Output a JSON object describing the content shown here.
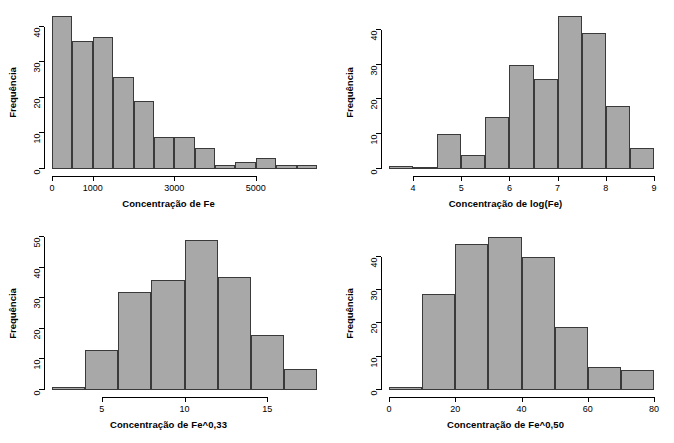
{
  "figure": {
    "panel_count": 4,
    "bar_fill_color": "#a8a8a8",
    "bar_border_color": "#3a3a3a",
    "background_color": "#ffffff"
  },
  "chart_data": [
    {
      "type": "bar",
      "panel": "top-left",
      "title": "",
      "xlabel": "Concentração de Fe",
      "ylabel": "Frequência",
      "xticks": [
        0,
        1000,
        3000,
        5000
      ],
      "xtick_labels": [
        "0",
        "1000",
        "3000",
        "5000"
      ],
      "yticks": [
        0,
        10,
        20,
        30,
        40
      ],
      "ytick_labels": [
        "0",
        "10",
        "20",
        "30",
        "40"
      ],
      "xlim": [
        0,
        6500
      ],
      "ylim": [
        0,
        43
      ],
      "bin_width": 500,
      "bin_edges": [
        0,
        500,
        1000,
        1500,
        2000,
        2500,
        3000,
        3500,
        4000,
        4500,
        5000,
        5500,
        6000,
        6500
      ],
      "values": [
        43,
        36,
        37,
        26,
        19,
        9,
        9,
        6,
        1,
        2,
        3,
        1,
        1
      ],
      "grid": false,
      "legend": "none"
    },
    {
      "type": "bar",
      "panel": "top-right",
      "title": "",
      "xlabel": "Concentração de log(Fe)",
      "ylabel": "Frequência",
      "xticks": [
        4,
        5,
        6,
        7,
        8,
        9
      ],
      "xtick_labels": [
        "4",
        "5",
        "6",
        "7",
        "8",
        "9"
      ],
      "yticks": [
        0,
        10,
        20,
        30,
        40
      ],
      "ytick_labels": [
        "0",
        "10",
        "20",
        "30",
        "40"
      ],
      "xlim": [
        3.5,
        9.0
      ],
      "ylim": [
        0,
        44
      ],
      "bin_width": 0.5,
      "bin_edges": [
        3.5,
        4.0,
        4.5,
        5.0,
        5.5,
        6.0,
        6.5,
        7.0,
        7.5,
        8.0,
        8.5,
        9.0
      ],
      "values": [
        1,
        0,
        10,
        4,
        15,
        30,
        26,
        44,
        39,
        18,
        6
      ],
      "grid": false,
      "legend": "none"
    },
    {
      "type": "bar",
      "panel": "bottom-left",
      "title": "",
      "xlabel": "Concentração de Fe^0,33",
      "ylabel": "Frequência",
      "xticks": [
        5,
        10,
        15
      ],
      "xtick_labels": [
        "5",
        "10",
        "15"
      ],
      "yticks": [
        0,
        10,
        20,
        30,
        40,
        50
      ],
      "ytick_labels": [
        "0",
        "10",
        "20",
        "30",
        "40",
        "50"
      ],
      "xlim": [
        2,
        18
      ],
      "ylim": [
        0,
        49
      ],
      "bin_width": 2,
      "bin_edges": [
        2,
        4,
        6,
        8,
        10,
        12,
        14,
        16,
        18
      ],
      "values": [
        1,
        13,
        32,
        36,
        49,
        37,
        18,
        7
      ],
      "grid": false,
      "legend": "none"
    },
    {
      "type": "bar",
      "panel": "bottom-right",
      "title": "",
      "xlabel": "Concentração de Fe^0,50",
      "ylabel": "Frequência",
      "xticks": [
        0,
        20,
        40,
        60,
        80
      ],
      "xtick_labels": [
        "0",
        "20",
        "40",
        "60",
        "80"
      ],
      "yticks": [
        0,
        10,
        20,
        30,
        40
      ],
      "ytick_labels": [
        "0",
        "10",
        "20",
        "30",
        "40"
      ],
      "xlim": [
        0,
        80
      ],
      "ylim": [
        0,
        46
      ],
      "bin_width": 10,
      "bin_edges": [
        0,
        10,
        20,
        30,
        40,
        50,
        60,
        70,
        80
      ],
      "values": [
        1,
        29,
        44,
        46,
        40,
        19,
        7,
        6
      ],
      "grid": false,
      "legend": "none"
    }
  ]
}
